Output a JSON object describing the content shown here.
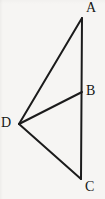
{
  "figure": {
    "kind": "geometry-line-diagram",
    "background_color": "#f6f5f3",
    "stroke_color": "#1b1b1b",
    "stroke_width": 2,
    "label_color": "#171717",
    "canvas": {
      "width": 105,
      "height": 199
    },
    "vertices": [
      {
        "id": "A",
        "label": "A",
        "x": 82,
        "y": 18
      },
      {
        "id": "B",
        "label": "B",
        "x": 82,
        "y": 92
      },
      {
        "id": "C",
        "label": "C",
        "x": 81,
        "y": 179
      },
      {
        "id": "D",
        "label": "D",
        "x": 19,
        "y": 124
      }
    ],
    "segments": [
      {
        "id": "AC",
        "from": "A",
        "to": "C",
        "x1": 82,
        "y1": 18,
        "x2": 81,
        "y2": 179
      },
      {
        "id": "AD",
        "from": "A",
        "to": "D",
        "x1": 82,
        "y1": 18,
        "x2": 19,
        "y2": 124
      },
      {
        "id": "BD",
        "from": "B",
        "to": "D",
        "x1": 82,
        "y1": 92,
        "x2": 19,
        "y2": 124
      },
      {
        "id": "CD",
        "from": "C",
        "to": "D",
        "x1": 81,
        "y1": 179,
        "x2": 19,
        "y2": 124
      }
    ]
  }
}
